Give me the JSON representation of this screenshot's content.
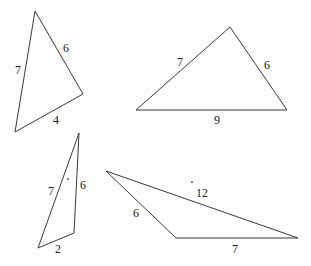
{
  "figure": {
    "stroke_color": "#3a3a3a",
    "label_color": "#222222",
    "triangles": [
      {
        "id": "triangle-1",
        "points": "35,11 83,94 15,132",
        "sides": [
          {
            "label": "7",
            "x": 18,
            "y": 70
          },
          {
            "label": "6",
            "x": 66,
            "y": 48
          },
          {
            "label": "4",
            "x": 56,
            "y": 120
          }
        ]
      },
      {
        "id": "triangle-2",
        "points": "230,27 287,110 136,110",
        "sides": [
          {
            "label": "7",
            "x": 180,
            "y": 62
          },
          {
            "label": "6",
            "x": 267,
            "y": 65
          },
          {
            "label": "9",
            "x": 217,
            "y": 120
          }
        ]
      },
      {
        "id": "triangle-3",
        "points": "79,133 74,233 38,248",
        "sides": [
          {
            "label": "7",
            "x": 51,
            "y": 191
          },
          {
            "label": "6",
            "x": 83,
            "y": 185
          },
          {
            "label": "2",
            "x": 58,
            "y": 249
          }
        ]
      },
      {
        "id": "triangle-4",
        "points": "106,171 176,238 298,238",
        "sides": [
          {
            "label": "6",
            "x": 136,
            "y": 213
          },
          {
            "label": "12",
            "x": 202,
            "y": 193
          },
          {
            "label": "7",
            "x": 235,
            "y": 249
          }
        ]
      }
    ],
    "dots": [
      {
        "x": 68,
        "y": 179
      },
      {
        "x": 192,
        "y": 182
      }
    ]
  }
}
